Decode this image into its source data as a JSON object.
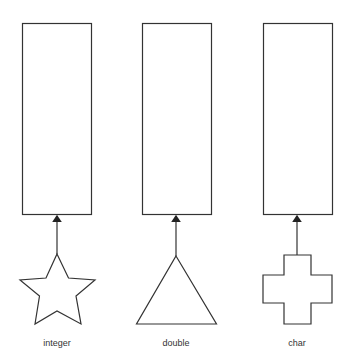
{
  "diagram": {
    "columns": [
      {
        "label": "integer",
        "shape": "star",
        "box": "empty-box"
      },
      {
        "label": "double",
        "shape": "triangle",
        "box": "empty-box"
      },
      {
        "label": "char",
        "shape": "cross",
        "box": "empty-box"
      }
    ],
    "stroke_color": "#333333"
  }
}
